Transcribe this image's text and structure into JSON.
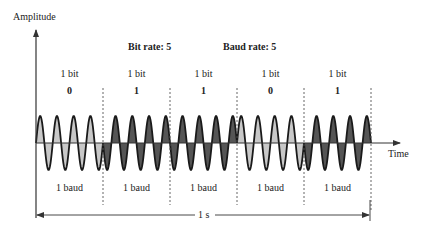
{
  "diagram": {
    "y_axis_label": "Amplitude",
    "x_axis_label": "Time",
    "bit_rate_label": "Bit rate: 5",
    "baud_rate_label": "Baud rate: 5",
    "duration_label": "1 s",
    "bit_unit_label": "1 bit",
    "baud_unit_label": "1 baud",
    "bits": [
      "0",
      "1",
      "1",
      "0",
      "1"
    ],
    "cycles_per_bit": 4,
    "colors": {
      "phase_0_fill": "#c8c8c8",
      "phase_1_fill": "#555555",
      "stroke": "#1a1a1a",
      "axis": "#333333",
      "divider": "#555555"
    }
  },
  "segments": [
    {
      "bit_label": "1 bit",
      "bit_value": "0",
      "baud_label": "1 baud"
    },
    {
      "bit_label": "1 bit",
      "bit_value": "1",
      "baud_label": "1 baud"
    },
    {
      "bit_label": "1 bit",
      "bit_value": "1",
      "baud_label": "1 baud"
    },
    {
      "bit_label": "1 bit",
      "bit_value": "0",
      "baud_label": "1 baud"
    },
    {
      "bit_label": "1 bit",
      "bit_value": "1",
      "baud_label": "1 baud"
    }
  ]
}
